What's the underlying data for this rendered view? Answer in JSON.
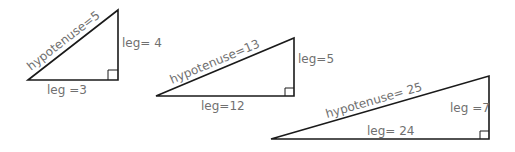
{
  "diagram": {
    "title": "",
    "triangles": [
      {
        "hypotenuse_label": "hypotenuse=5",
        "vertical_leg_label": "leg= 4",
        "horizontal_leg_label": "leg =3",
        "hypotenuse": 5,
        "legs": [
          3,
          4
        ]
      },
      {
        "hypotenuse_label": "hypotenuse=13",
        "vertical_leg_label": "leg=5",
        "horizontal_leg_label": "leg=12",
        "hypotenuse": 13,
        "legs": [
          12,
          5
        ]
      },
      {
        "hypotenuse_label": "hypotenuse=  25",
        "vertical_leg_label": "leg =7",
        "horizontal_leg_label": "leg= 24",
        "hypotenuse": 25,
        "legs": [
          24,
          7
        ]
      }
    ],
    "colors": {
      "line": "#1a1a1a",
      "label": "#707070",
      "background": "#ffffff"
    }
  }
}
